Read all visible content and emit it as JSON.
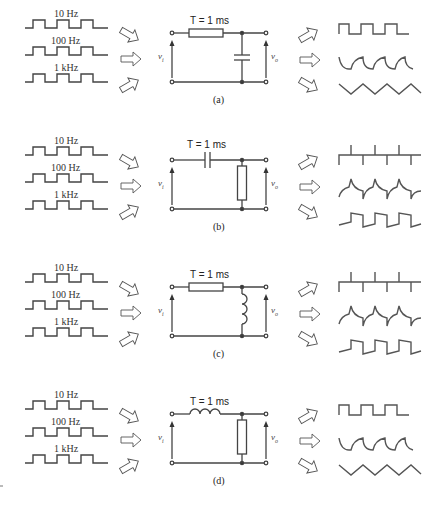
{
  "figure": {
    "inputs": [
      "10 Hz",
      "100 Hz",
      "1 kHz"
    ],
    "v_in": "v",
    "v_in_sub": "i",
    "v_out": "v",
    "v_out_sub": "o",
    "panels": [
      {
        "id": "a",
        "caption": "(a)",
        "time_constant": "T = 1 ms",
        "series_element": "resistor",
        "shunt_element": "capacitor",
        "outputs": [
          "square (slightly rounded)",
          "exponential charge/discharge",
          "triangle"
        ]
      },
      {
        "id": "b",
        "caption": "(b)",
        "time_constant": "T = 1 ms",
        "series_element": "capacitor",
        "shunt_element": "resistor",
        "outputs": [
          "spikes",
          "exponential decay spikes",
          "tilted square"
        ]
      },
      {
        "id": "c",
        "caption": "(c)",
        "time_constant": "T = 1 ms",
        "series_element": "resistor",
        "shunt_element": "inductor",
        "outputs": [
          "spikes",
          "exponential decay spikes",
          "tilted square"
        ]
      },
      {
        "id": "d",
        "caption": "(d)",
        "time_constant": "T = 1 ms",
        "series_element": "inductor",
        "shunt_element": "resistor",
        "outputs": [
          "square (slightly rounded)",
          "exponential charge/discharge",
          "triangle"
        ]
      }
    ]
  }
}
